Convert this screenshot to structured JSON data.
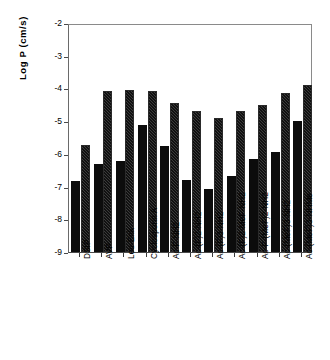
{
  "chart_data": {
    "type": "bar",
    "title": "",
    "subtitle": "",
    "xlabel": "",
    "ylabel": "Log P  (cm/s)",
    "ylim": [
      -9,
      -2
    ],
    "ytick_labels": [
      "-2",
      "-3",
      "-4",
      "-5",
      "-6",
      "-7",
      "-8",
      "-9"
    ],
    "ytick_values": [
      -2,
      -3,
      -4,
      -5,
      -6,
      -7,
      -8,
      -9
    ],
    "grid": false,
    "legend": "none",
    "legend_position": "none",
    "bar_base": -9,
    "categories": [
      "DSIP",
      "AVP",
      "Leu-Enk",
      "Cyclosporin A",
      "Ac-F-NH2",
      "Ac-(F)2-NH2",
      "Ac-(F)3-NH2",
      "Ac-(F)2-MeF-NH2",
      "Ac-F-(MeF)2-NH2",
      "Ac-(MeF)3-NH2",
      "Ac-(MeF)3-NHMe"
    ],
    "series": [
      {
        "name": "solid",
        "fill": "solid-black",
        "color": "#0c0c0c",
        "values": [
          -6.84,
          -6.31,
          -6.22,
          -5.13,
          -5.77,
          -6.79,
          -7.07,
          -6.69,
          -6.17,
          -5.94,
          -5.01
        ]
      },
      {
        "name": "hatched",
        "fill": "diagonal-hatch",
        "color": "#3b3b3b",
        "values": [
          -5.72,
          -4.07,
          -4.05,
          -4.07,
          -4.43,
          -4.68,
          -4.89,
          -4.68,
          -4.52,
          -4.15,
          -3.91
        ]
      }
    ]
  },
  "figure": {
    "background": "#ffffff",
    "axis_color": "#4a4a4a",
    "frame": true
  }
}
